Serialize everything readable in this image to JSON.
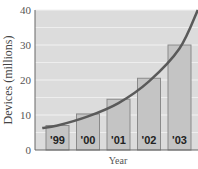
{
  "chart_data": {
    "type": "bar",
    "title": "",
    "xlabel": "Year",
    "ylabel": "Devices (millions)",
    "categories": [
      "'99",
      "'00",
      "'01",
      "'02",
      "'03"
    ],
    "values": [
      7,
      10.3,
      14.5,
      20.5,
      30
    ],
    "ylim": [
      0,
      40
    ],
    "yticks": [
      0,
      10,
      20,
      30,
      40
    ],
    "grid": true,
    "legend": null,
    "overlay": {
      "type": "line",
      "description": "exponential growth trend curve",
      "points": [
        [
          -0.5,
          6.3
        ],
        [
          0,
          7.0
        ],
        [
          1,
          9.6
        ],
        [
          2,
          13.4
        ],
        [
          3,
          19.6
        ],
        [
          4,
          29.0
        ],
        [
          4.6,
          40
        ]
      ]
    },
    "colors": {
      "plot_background": "#dcdcdc",
      "gridline": "#f2f2f2",
      "bar_fill": "#c4c4c4",
      "bar_stroke": "#8a8a8a",
      "curve": "#5a5a5a",
      "axis": "#666666"
    }
  }
}
